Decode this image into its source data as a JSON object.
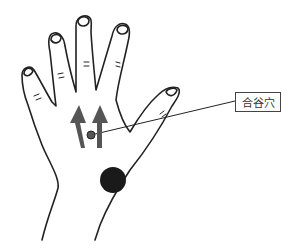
{
  "diagram": {
    "callout": {
      "label": "合谷穴",
      "point": {
        "x": 91,
        "y": 135
      }
    },
    "markers": [
      {
        "name": "acupoint-dot",
        "x": 91,
        "y": 135,
        "r": 4,
        "color": "#555555"
      },
      {
        "name": "large-dot",
        "x": 113,
        "y": 180,
        "r": 13,
        "color": "#1a1a1a"
      }
    ],
    "arrows": [
      {
        "name": "arrow-left",
        "direction": "up",
        "color": "#555555"
      },
      {
        "name": "arrow-right",
        "direction": "up",
        "color": "#555555"
      }
    ],
    "colors": {
      "line": "#222222",
      "arrow": "#555555",
      "dot": "#1a1a1a"
    }
  }
}
